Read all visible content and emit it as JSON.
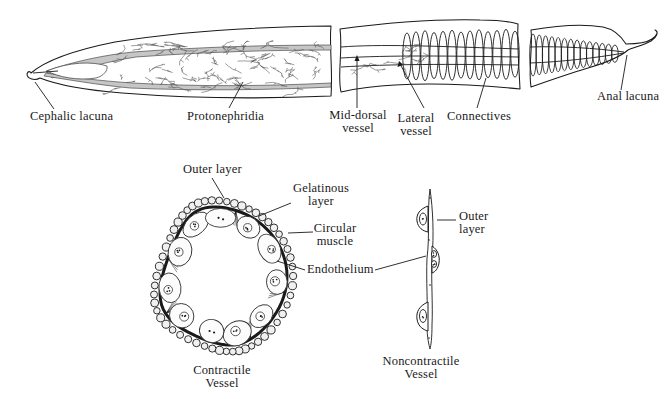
{
  "labels": {
    "cephalic_lacuna": "Cephalic lacuna",
    "protonephridia": "Protonephridia",
    "mid_dorsal_vessel": "Mid-dorsal\nvessel",
    "lateral_vessel": "Lateral\nvessel",
    "connectives": "Connectives",
    "anal_lacuna": "Anal lacuna",
    "outer_layer_contractile": "Outer layer",
    "gelatinous_layer": "Gelatinous\nlayer",
    "circular_muscle": "Circular\nmuscle",
    "endothelium": "Endothelium",
    "outer_layer_noncontractile": "Outer\nlayer",
    "contractile_caption": "Contractile\nVessel",
    "noncontractile_caption": "Noncontractile\nVessel"
  },
  "colors": {
    "ink": "#1a1a1a",
    "ink_light": "#4a4a4a",
    "vessel_gray": "#c6c6c6",
    "background": "#ffffff"
  }
}
